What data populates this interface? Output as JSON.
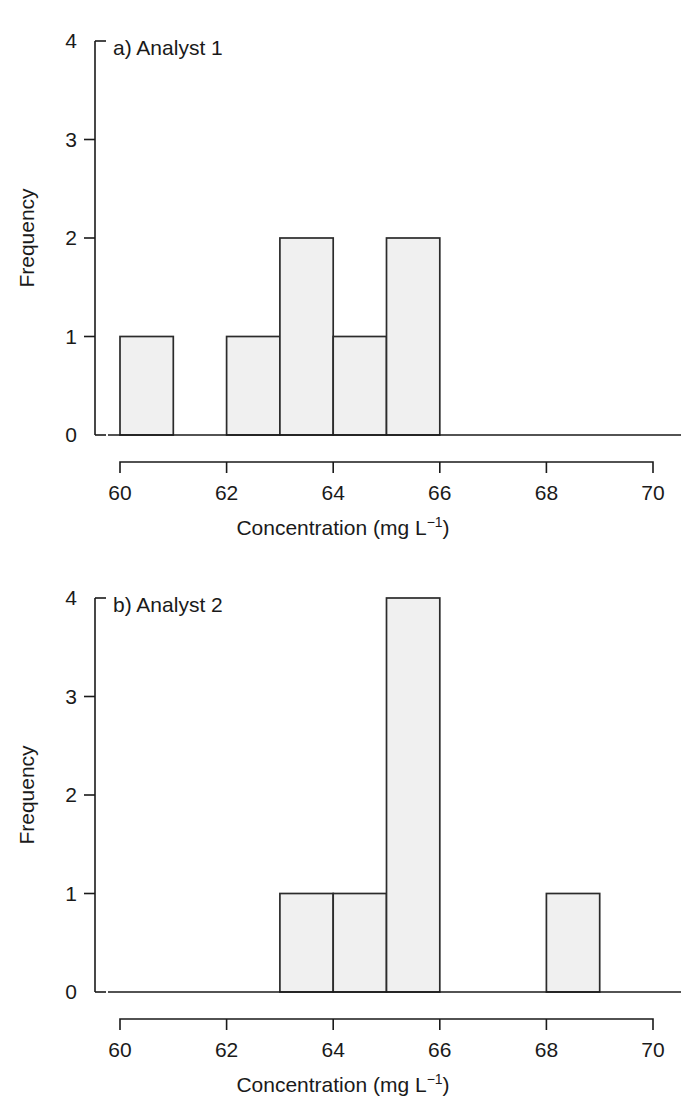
{
  "figure": {
    "background": "#ffffff",
    "bar_fill": "#f0f0f0",
    "bar_stroke": "#2b2b2b",
    "axis_color": "#1a1a1a"
  },
  "panels": [
    {
      "tag": "a) Analyst 1",
      "ylabel": "Frequency",
      "xlabel_main": "Concentration (mg L",
      "xlabel_sup": "−1",
      "xlabel_tail": ")",
      "xlabel_full": "Concentration (mg L⁻¹)",
      "xticks": [
        "60",
        "62",
        "64",
        "66",
        "68",
        "70"
      ],
      "yticks": [
        "0",
        "1",
        "2",
        "3",
        "4"
      ]
    },
    {
      "tag": "b) Analyst 2",
      "ylabel": "Frequency",
      "xlabel_main": "Concentration (mg L",
      "xlabel_sup": "−1",
      "xlabel_tail": ")",
      "xlabel_full": "Concentration (mg L⁻¹)",
      "xticks": [
        "60",
        "62",
        "64",
        "66",
        "68",
        "70"
      ],
      "yticks": [
        "0",
        "1",
        "2",
        "3",
        "4"
      ]
    }
  ],
  "chart_data": [
    {
      "type": "bar",
      "title": "a) Analyst 1",
      "xlabel": "Concentration (mg L⁻¹)",
      "ylabel": "Frequency",
      "xlim": [
        60,
        70
      ],
      "ylim": [
        0,
        4
      ],
      "xticks": [
        60,
        62,
        64,
        66,
        68,
        70
      ],
      "yticks": [
        0,
        1,
        2,
        3,
        4
      ],
      "grid": false,
      "legend": "none",
      "bin_width": 1,
      "bins": [
        {
          "x0": 60,
          "x1": 61,
          "value": 1
        },
        {
          "x0": 62,
          "x1": 63,
          "value": 1
        },
        {
          "x0": 63,
          "x1": 64,
          "value": 2
        },
        {
          "x0": 64,
          "x1": 65,
          "value": 1
        },
        {
          "x0": 65,
          "x1": 66,
          "value": 2
        }
      ],
      "categories": [
        "60-61",
        "61-62",
        "62-63",
        "63-64",
        "64-65",
        "65-66",
        "66-67",
        "67-68",
        "68-69",
        "69-70"
      ],
      "values": [
        1,
        0,
        1,
        2,
        1,
        2,
        0,
        0,
        0,
        0
      ]
    },
    {
      "type": "bar",
      "title": "b) Analyst 2",
      "xlabel": "Concentration (mg L⁻¹)",
      "ylabel": "Frequency",
      "xlim": [
        60,
        70
      ],
      "ylim": [
        0,
        4
      ],
      "xticks": [
        60,
        62,
        64,
        66,
        68,
        70
      ],
      "yticks": [
        0,
        1,
        2,
        3,
        4
      ],
      "grid": false,
      "legend": "none",
      "bin_width": 1,
      "bins": [
        {
          "x0": 63,
          "x1": 64,
          "value": 1
        },
        {
          "x0": 64,
          "x1": 65,
          "value": 1
        },
        {
          "x0": 65,
          "x1": 66,
          "value": 4
        },
        {
          "x0": 68,
          "x1": 69,
          "value": 1
        }
      ],
      "categories": [
        "60-61",
        "61-62",
        "62-63",
        "63-64",
        "64-65",
        "65-66",
        "66-67",
        "67-68",
        "68-69",
        "69-70"
      ],
      "values": [
        0,
        0,
        0,
        1,
        1,
        4,
        0,
        0,
        1,
        0
      ]
    }
  ]
}
